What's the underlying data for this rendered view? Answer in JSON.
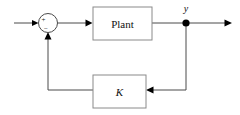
{
  "diagram": {
    "type": "control-block-diagram",
    "background_color": "#ffffff",
    "line_color": "#4a4a4a",
    "box_border_color": "#8a8a8a",
    "text_color": "#111111",
    "blocks": [
      {
        "id": "plant",
        "label": "Plant",
        "style": "upright",
        "x": 93,
        "y": 7,
        "width": 59,
        "height": 33
      },
      {
        "id": "controller",
        "label": "K",
        "style": "italic",
        "x": 93,
        "y": 75,
        "width": 53,
        "height": 33
      }
    ],
    "summing_junction": {
      "id": "sum",
      "cx": 48,
      "cy": 23,
      "r": 9.5,
      "signs": [
        {
          "label": "+",
          "position": "upper-left",
          "x": 43.5,
          "y": 21
        },
        {
          "label": "−",
          "position": "lower-center",
          "x": 45.5,
          "y": 30
        }
      ]
    },
    "nodes": [
      {
        "id": "y-node",
        "label": "y",
        "label_style": "italic",
        "cx": 186,
        "cy": 23,
        "r": 3.6,
        "label_x": 183,
        "label_y": 11
      }
    ],
    "signals": [
      {
        "id": "reference-input",
        "from": "left-edge",
        "to": "sum",
        "direction": "right"
      },
      {
        "id": "error-signal",
        "from": "sum",
        "to": "plant",
        "direction": "right"
      },
      {
        "id": "plant-output",
        "from": "plant",
        "to": "y-node",
        "direction": "right"
      },
      {
        "id": "output-signal",
        "from": "y-node",
        "to": "right-edge",
        "direction": "right"
      },
      {
        "id": "feedback-sense",
        "from": "y-node",
        "to": "controller",
        "direction": "left"
      },
      {
        "id": "feedback-signal",
        "from": "controller",
        "to": "sum",
        "direction": "up"
      }
    ]
  }
}
